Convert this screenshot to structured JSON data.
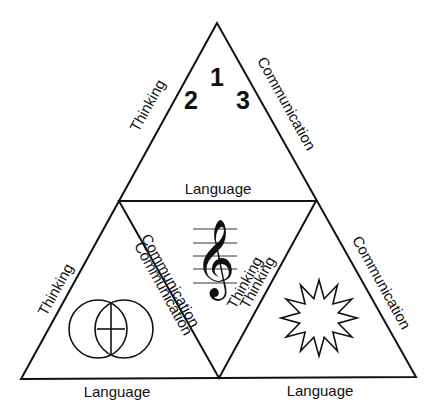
{
  "diagram": {
    "type": "nested-triangle",
    "top_triangle": {
      "numbers": [
        "1",
        "2",
        "3"
      ],
      "left_side": "Thinking",
      "right_side": "Communication",
      "bottom_side": "Language"
    },
    "center_triangle": {
      "symbol": "treble-clef-on-staff",
      "left_side": "Communication",
      "right_side": "Thinking"
    },
    "left_triangle": {
      "symbol": "overlapping-circles",
      "left_side": "Thinking",
      "right_side": "Communication",
      "bottom_side": "Language"
    },
    "right_triangle": {
      "symbol": "twelve-point-star",
      "left_side": "Thinking",
      "right_side": "Communication",
      "bottom_side": "Language"
    },
    "colors": {
      "stroke": "#111111",
      "background": "#ffffff"
    }
  },
  "glyphs": {
    "clef": "𝄞"
  }
}
